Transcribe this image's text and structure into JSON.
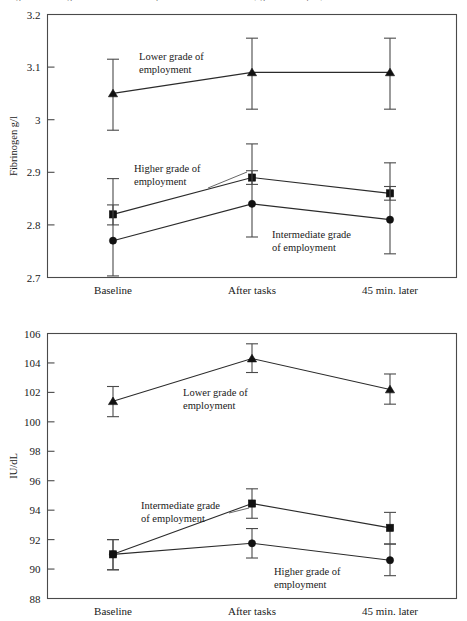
{
  "page": {
    "caption_cut_top": "Figure: Fibrinogen and factor VIII responses to mental stress by grade of employment"
  },
  "chart_data": [
    {
      "id": "fibrinogen",
      "type": "line",
      "title": "",
      "xlabel": "",
      "ylabel": "Fibrinogen g/l",
      "categories": [
        "Baseline",
        "After tasks",
        "45 min. later"
      ],
      "yticks": [
        "3.2",
        "3.1",
        "3",
        "2.9",
        "2.8",
        "2.7"
      ],
      "ylim": [
        2.7,
        3.2
      ],
      "grid": false,
      "legend_position": "inline-annotations",
      "series": [
        {
          "name": "Lower grade of employment",
          "marker": "triangle",
          "values": [
            3.05,
            3.09,
            3.09
          ],
          "err_low": [
            2.98,
            3.02,
            3.02
          ],
          "err_high": [
            3.115,
            3.155,
            3.155
          ],
          "annotation": "Lower grade of\nemployment"
        },
        {
          "name": "Higher grade of employment",
          "marker": "square",
          "values": [
            2.82,
            2.89,
            2.86
          ],
          "err_low": [
            2.8,
            2.877,
            2.847
          ],
          "err_high": [
            2.838,
            2.903,
            2.873
          ],
          "annotation": "Higher grade of\nemployment"
        },
        {
          "name": "Intermediate grade of employment",
          "marker": "circle",
          "values": [
            2.77,
            2.84,
            2.81
          ],
          "err_low": [
            2.703,
            2.777,
            2.745
          ],
          "err_high": [
            2.888,
            2.954,
            2.918
          ],
          "annotation": "Intermediate grade\nof employment"
        }
      ]
    },
    {
      "id": "factor-viii",
      "type": "line",
      "title": "",
      "xlabel": "",
      "ylabel": "IU/dL",
      "categories": [
        "Baseline",
        "After tasks",
        "45 min. later"
      ],
      "yticks": [
        "106",
        "104",
        "102",
        "100",
        "98",
        "96",
        "94",
        "92",
        "90",
        "88"
      ],
      "ylim": [
        88,
        106
      ],
      "grid": false,
      "legend_position": "inline-annotations",
      "series": [
        {
          "name": "Lower grade of employment",
          "marker": "triangle",
          "values": [
            101.4,
            104.3,
            102.2
          ],
          "err_low": [
            100.35,
            103.35,
            101.2
          ],
          "err_high": [
            102.4,
            105.3,
            103.25
          ],
          "annotation": "Lower grade of\nemployment"
        },
        {
          "name": "Intermediate grade of employment",
          "marker": "square",
          "values": [
            91.0,
            94.45,
            92.8
          ],
          "err_low": [
            89.95,
            93.45,
            91.7
          ],
          "err_high": [
            92.0,
            95.45,
            93.85
          ],
          "annotation": "Intermediate grade\nof employment"
        },
        {
          "name": "Higher grade of employment",
          "marker": "circle",
          "values": [
            91.0,
            91.75,
            90.6
          ],
          "err_low": [
            89.95,
            90.75,
            89.55
          ],
          "err_high": [
            92.0,
            92.75,
            91.7
          ],
          "annotation": "Higher grade of\nemployment"
        }
      ]
    }
  ],
  "annotations": {
    "top": {
      "lower": {
        "line1": "Lower grade of",
        "line2": "employment"
      },
      "higher": {
        "line1": "Higher grade of",
        "line2": "employment"
      },
      "intermediate": {
        "line1": "Intermediate grade",
        "line2": "of employment"
      }
    },
    "bottom": {
      "lower": {
        "line1": "Lower grade of",
        "line2": "employment"
      },
      "intermediate": {
        "line1": "Intermediate grade",
        "line2": "of employment"
      },
      "higher": {
        "line1": "Higher grade of",
        "line2": "employment"
      }
    }
  }
}
